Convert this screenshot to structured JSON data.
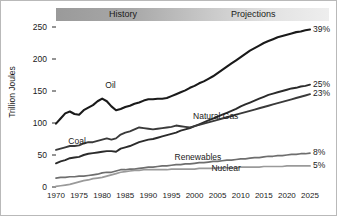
{
  "chart_data": {
    "type": "line",
    "title": "",
    "xlabel": "",
    "ylabel": "Trillion Joules",
    "xlim": [
      1970,
      2025
    ],
    "ylim": [
      0,
      250
    ],
    "yticks": [
      0,
      50,
      100,
      150,
      200,
      250
    ],
    "xticks": [
      1970,
      1975,
      1980,
      1985,
      1990,
      1995,
      2000,
      2005,
      2010,
      2015,
      2020,
      2025
    ],
    "grid": false,
    "legend_position": "inline-labels",
    "annotations": [
      {
        "text": "History",
        "type": "period-banner",
        "span": [
          1970,
          2002
        ]
      },
      {
        "text": "Projections",
        "type": "period-banner",
        "span": [
          2002,
          2025
        ]
      }
    ],
    "end_labels": [
      {
        "series": "Oil",
        "text": "39%"
      },
      {
        "series": "Natural Gas",
        "text": "25%"
      },
      {
        "series": "Coal",
        "text": "23%"
      },
      {
        "series": "Renewables",
        "text": "8%"
      },
      {
        "series": "Nuclear",
        "text": "5%"
      }
    ],
    "x": [
      1970,
      1971,
      1972,
      1973,
      1974,
      1975,
      1976,
      1977,
      1978,
      1979,
      1980,
      1981,
      1982,
      1983,
      1984,
      1985,
      1986,
      1987,
      1988,
      1989,
      1990,
      1991,
      1992,
      1993,
      1994,
      1995,
      1996,
      1997,
      1998,
      1999,
      2000,
      2001,
      2002,
      2003,
      2004,
      2005,
      2006,
      2007,
      2008,
      2009,
      2010,
      2011,
      2012,
      2013,
      2014,
      2015,
      2016,
      2017,
      2018,
      2019,
      2020,
      2021,
      2022,
      2023,
      2024,
      2025
    ],
    "series": [
      {
        "name": "Oil",
        "color": "#1a1a1a",
        "width": 2.1,
        "label_pos": [
          1985,
          158
        ],
        "values": [
          99,
          107,
          115,
          118,
          114,
          113,
          120,
          124,
          128,
          134,
          138,
          134,
          126,
          120,
          122,
          125,
          127,
          130,
          132,
          135,
          137,
          137,
          138,
          138,
          139,
          142,
          145,
          148,
          151,
          155,
          158,
          162,
          165,
          169,
          173,
          178,
          183,
          188,
          193,
          198,
          203,
          208,
          213,
          217,
          221,
          225,
          228,
          231,
          234,
          236,
          238,
          240,
          242,
          243,
          245,
          246
        ]
      },
      {
        "name": "Natural Gas",
        "color": "#2b2b2b",
        "width": 1.9,
        "label_pos": [
          2004,
          110
        ],
        "values": [
          37,
          40,
          42,
          45,
          46,
          47,
          50,
          52,
          53,
          54,
          55,
          56,
          56,
          55,
          60,
          62,
          64,
          67,
          70,
          72,
          74,
          75,
          77,
          79,
          81,
          83,
          85,
          88,
          90,
          92,
          95,
          98,
          101,
          104,
          107,
          110,
          113,
          116,
          119,
          122,
          126,
          129,
          132,
          135,
          138,
          141,
          144,
          146,
          148,
          150,
          152,
          154,
          155,
          157,
          158,
          160
        ]
      },
      {
        "name": "Coal",
        "color": "#3a3a3a",
        "width": 1.9,
        "label_pos": [
          1977,
          70
        ],
        "values": [
          58,
          60,
          62,
          64,
          64,
          65,
          68,
          70,
          70,
          72,
          74,
          76,
          74,
          76,
          82,
          85,
          87,
          90,
          93,
          92,
          91,
          90,
          91,
          92,
          93,
          94,
          96,
          95,
          94,
          93,
          95,
          97,
          99,
          101,
          103,
          105,
          107,
          109,
          111,
          113,
          115,
          117,
          119,
          121,
          123,
          125,
          127,
          129,
          131,
          133,
          135,
          137,
          139,
          141,
          143,
          145
        ]
      },
      {
        "name": "Renewables",
        "color": "#6e6e6e",
        "width": 1.7,
        "label_pos": [
          2000,
          45
        ],
        "values": [
          14,
          15,
          15,
          16,
          16,
          17,
          17,
          18,
          19,
          20,
          22,
          23,
          23,
          25,
          27,
          27,
          28,
          28,
          29,
          30,
          31,
          31,
          32,
          33,
          33,
          34,
          35,
          35,
          36,
          36,
          37,
          38,
          38,
          39,
          40,
          40,
          41,
          42,
          42,
          43,
          44,
          44,
          45,
          46,
          46,
          47,
          48,
          48,
          49,
          49,
          50,
          51,
          51,
          52,
          52,
          53
        ]
      },
      {
        "name": "Nuclear",
        "color": "#9a9a9a",
        "width": 1.7,
        "label_pos": [
          2008,
          28
        ],
        "values": [
          1,
          2,
          3,
          4,
          6,
          8,
          10,
          11,
          13,
          14,
          15,
          17,
          19,
          21,
          23,
          24,
          25,
          26,
          26,
          27,
          27,
          27,
          27,
          27,
          27,
          28,
          28,
          28,
          28,
          28,
          28,
          29,
          29,
          29,
          29,
          30,
          30,
          30,
          30,
          30,
          31,
          31,
          31,
          31,
          31,
          32,
          32,
          32,
          32,
          32,
          33,
          33,
          33,
          33,
          33,
          33
        ]
      }
    ]
  },
  "banner": {
    "history_label": "History",
    "projections_label": "Projections"
  }
}
